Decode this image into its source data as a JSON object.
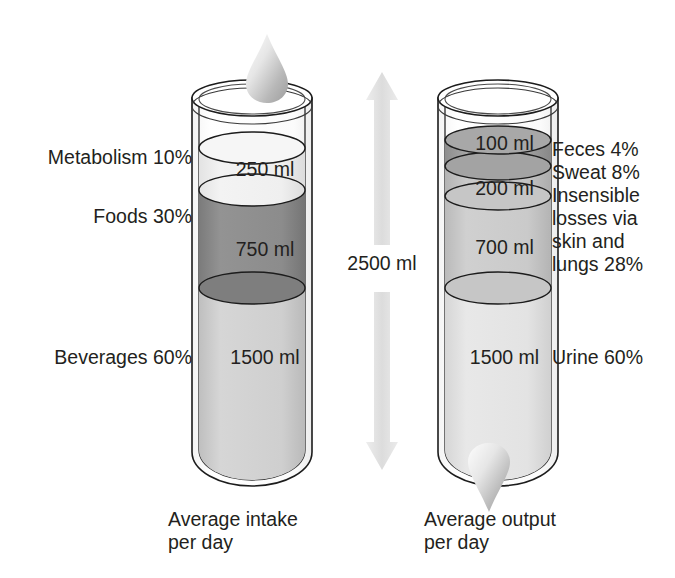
{
  "diagram": {
    "background_color": "#ffffff",
    "text_color": "#231f20",
    "total": {
      "value_label": "2500 ml",
      "amount_ml": 2500,
      "unit": "ml"
    },
    "arrow": {
      "name": "double-headed-vertical-arrow",
      "direction": "up-and-down",
      "color": "#e2e2e2"
    },
    "intake": {
      "caption": "Average intake\nper day",
      "caption_line1": "Average intake",
      "caption_line2": "per day",
      "total_ml": 2500,
      "droplet_position": "top",
      "segments": [
        {
          "name": "metabolism",
          "label": "Metabolism 10%",
          "source": "Metabolism",
          "percent": 10,
          "volume_label": "250 ml",
          "volume_ml": 250,
          "fill_color": "#eeeeee"
        },
        {
          "name": "foods",
          "label": "Foods 30%",
          "source": "Foods",
          "percent": 30,
          "volume_label": "750 ml",
          "volume_ml": 750,
          "fill_color": "#888888"
        },
        {
          "name": "beverages",
          "label": "Beverages 60%",
          "source": "Beverages",
          "percent": 60,
          "volume_label": "1500 ml",
          "volume_ml": 1500,
          "fill_color": "#cdcdcd"
        }
      ]
    },
    "output": {
      "caption": "Average output\nper day",
      "caption_line1": "Average output",
      "caption_line2": "per day",
      "total_ml": 2500,
      "droplet_position": "bottom",
      "segments": [
        {
          "name": "feces",
          "label": "Feces 4%",
          "source": "Feces",
          "percent": 4,
          "volume_label": "100 ml",
          "volume_ml": 100,
          "fill_color": "#9a9a9a"
        },
        {
          "name": "sweat",
          "label": "Sweat 8%",
          "source": "Sweat",
          "percent": 8,
          "volume_label": "200 ml",
          "volume_ml": 200,
          "fill_color": "#c0c0c0"
        },
        {
          "name": "insensible-losses",
          "label": "Insensible\nlosses via\nskin and\nlungs 28%",
          "label_line1": "Insensible",
          "label_line2": "losses via",
          "label_line3": "skin and",
          "label_line4": "lungs 28%",
          "source": "Insensible losses via skin and lungs",
          "percent": 28,
          "volume_label": "700 ml",
          "volume_ml": 700,
          "fill_color": "#c8c8c8"
        },
        {
          "name": "urine",
          "label": "Urine 60%",
          "source": "Urine",
          "percent": 60,
          "volume_label": "1500 ml",
          "volume_ml": 1500,
          "fill_color": "#e0e0e0"
        }
      ]
    }
  }
}
